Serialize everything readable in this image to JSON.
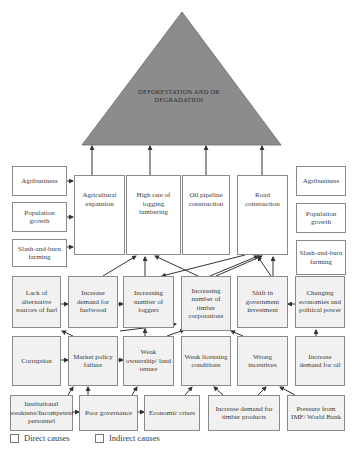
{
  "apex": {
    "label": "DEFORESTATION AND OR DEGRADATION",
    "color": "#8c8c8c"
  },
  "direct_causes": [
    {
      "id": "agri-exp",
      "label": "Agricultural expansion"
    },
    {
      "id": "logging",
      "label": "High rate of logging lumbering"
    },
    {
      "id": "oil",
      "label": "Oil pipeline construction"
    },
    {
      "id": "road",
      "label": "Road construction"
    }
  ],
  "left_side": [
    {
      "label": "Agribusiness"
    },
    {
      "label": "Population growth"
    },
    {
      "label": "Slash-and-burn farming"
    }
  ],
  "right_side": [
    {
      "label": "Agribusiness"
    },
    {
      "label": "Population growth"
    },
    {
      "label": "Slash-and-burn farming"
    }
  ],
  "row3": [
    {
      "label": "Lack of alternative sources of fuel"
    },
    {
      "label": "Increase demand for fuelwood"
    },
    {
      "label": "Increasing number of loggers"
    },
    {
      "label": "Increasing number of timber corporations"
    },
    {
      "label": "Shift in government investment"
    },
    {
      "label": "Changing economies and political power"
    }
  ],
  "row4": [
    {
      "label": "Corruption"
    },
    {
      "label": "Market policy failure"
    },
    {
      "label": "Weak ownership/ land tenure"
    },
    {
      "label": "Weak licensing conditions"
    },
    {
      "label": "Wrong incentives"
    },
    {
      "label": "Increase demand for oil"
    }
  ],
  "row5": [
    {
      "label": "Institutional weakness/Incompetent personnel"
    },
    {
      "label": "Poor governance"
    },
    {
      "label": "Economic crises"
    },
    {
      "label": "Increase demand for timber products"
    },
    {
      "label": "Pressure from IMF/ World Bank"
    }
  ],
  "legend": {
    "direct": "Direct causes",
    "indirect": "Indirect causes"
  }
}
